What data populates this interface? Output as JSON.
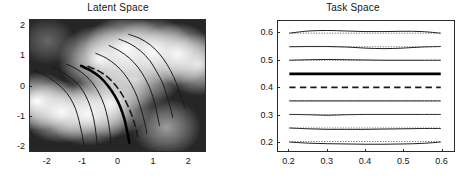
{
  "figure": {
    "background_color": "#ffffff",
    "panel_count": 2
  },
  "panels": [
    {
      "id": "latent",
      "title": "Latent Space"
    },
    {
      "id": "task",
      "title": "Task Space"
    }
  ],
  "chart_data": [
    {
      "type": "line",
      "id": "latent-space",
      "title": "Latent Space",
      "xlabel": "",
      "ylabel": "",
      "xlim": [
        -2.5,
        2.5
      ],
      "ylim": [
        2.2,
        -2.2
      ],
      "y_axis_inverted": true,
      "grid": false,
      "legend": "none",
      "xticks": [
        -2,
        -1,
        0,
        1,
        2
      ],
      "xtick_labels": [
        "-2",
        "-1",
        "0",
        "1",
        "2"
      ],
      "yticks": [
        -2,
        -1,
        0,
        1,
        2
      ],
      "ytick_labels": [
        "-2",
        "-1",
        "0",
        "1",
        "2"
      ],
      "background_image": {
        "type": "grayscale-density",
        "description": "bright diagonal band running lower-left to upper-right, dark corners upper-left and lower-right",
        "dark_color": "#262626",
        "light_color": "#ffffff"
      },
      "series": [
        {
          "name": "trajectory-1",
          "style": "solid",
          "linewidth": 1,
          "color": "#1a1a1a",
          "x": [
            -2.4,
            -2.1,
            -1.8,
            -1.55,
            -1.35,
            -1.2,
            -1.1,
            -1.02,
            -0.96
          ],
          "y": [
            0.52,
            0.36,
            0.14,
            -0.12,
            -0.42,
            -0.78,
            -1.18,
            -1.6,
            -2.0
          ]
        },
        {
          "name": "trajectory-2",
          "style": "solid",
          "linewidth": 1,
          "color": "#1a1a1a",
          "x": [
            -1.9,
            -1.62,
            -1.34,
            -1.1,
            -0.92,
            -0.78,
            -0.68,
            -0.62,
            -0.58
          ],
          "y": [
            0.64,
            0.48,
            0.26,
            0.0,
            -0.32,
            -0.7,
            -1.12,
            -1.56,
            -1.98
          ]
        },
        {
          "name": "trajectory-3",
          "style": "solid",
          "linewidth": 1,
          "color": "#1a1a1a",
          "x": [
            -1.46,
            -1.18,
            -0.92,
            -0.7,
            -0.52,
            -0.38,
            -0.28,
            -0.22,
            -0.18
          ],
          "y": [
            0.72,
            0.56,
            0.34,
            0.06,
            -0.28,
            -0.66,
            -1.1,
            -1.54,
            -1.96
          ]
        },
        {
          "name": "trajectory-4-thick",
          "style": "solid",
          "linewidth": 2.6,
          "color": "#000000",
          "x": [
            -1.04,
            -0.76,
            -0.5,
            -0.28,
            -0.08,
            0.08,
            0.2,
            0.28,
            0.34
          ],
          "y": [
            0.66,
            0.5,
            0.28,
            0.0,
            -0.34,
            -0.72,
            -1.14,
            -1.56,
            -1.92
          ]
        },
        {
          "name": "trajectory-5-dashed",
          "style": "dashed",
          "linewidth": 1.6,
          "color": "#1a1a1a",
          "x": [
            -0.84,
            -0.56,
            -0.3,
            -0.08,
            0.12,
            0.28,
            0.42,
            0.52,
            0.58
          ],
          "y": [
            0.64,
            0.5,
            0.3,
            0.04,
            -0.28,
            -0.64,
            -1.04,
            -1.42,
            -1.74
          ]
        },
        {
          "name": "trajectory-6",
          "style": "solid",
          "linewidth": 1,
          "color": "#1a1a1a",
          "x": [
            -0.24,
            0.06,
            0.34,
            0.58,
            0.78,
            0.94,
            1.06,
            1.14,
            1.2
          ],
          "y": [
            1.34,
            1.16,
            0.92,
            0.62,
            0.26,
            -0.14,
            -0.58,
            -1.0,
            -1.34
          ]
        },
        {
          "name": "trajectory-7",
          "style": "solid",
          "linewidth": 1,
          "color": "#1a1a1a",
          "x": [
            0.04,
            0.36,
            0.66,
            0.92,
            1.12,
            1.3,
            1.42,
            1.52,
            1.58
          ],
          "y": [
            1.56,
            1.4,
            1.16,
            0.84,
            0.46,
            0.06,
            -0.38,
            -0.78,
            -1.08
          ]
        },
        {
          "name": "trajectory-8",
          "style": "solid",
          "linewidth": 1,
          "color": "#1a1a1a",
          "x": [
            0.32,
            0.64,
            0.94,
            1.2,
            1.42,
            1.6,
            1.74,
            1.84,
            1.92
          ],
          "y": [
            1.72,
            1.58,
            1.36,
            1.06,
            0.7,
            0.3,
            -0.1,
            -0.46,
            -0.74
          ]
        },
        {
          "name": "trajectory-9",
          "style": "solid",
          "linewidth": 1,
          "color": "#1a1a1a",
          "x": [
            -0.62,
            -0.32,
            -0.04,
            0.2,
            0.4,
            0.56,
            0.68,
            0.78,
            0.84
          ],
          "y": [
            1.08,
            0.92,
            0.68,
            0.38,
            0.02,
            -0.38,
            -0.82,
            -1.26,
            -1.62
          ]
        }
      ]
    },
    {
      "type": "line",
      "id": "task-space",
      "title": "Task Space",
      "xlabel": "",
      "ylabel": "",
      "xlim": [
        0.17,
        0.635
      ],
      "ylim": [
        0.165,
        0.645
      ],
      "grid": false,
      "legend": "none",
      "xticks": [
        0.2,
        0.3,
        0.4,
        0.5,
        0.6
      ],
      "xtick_labels": [
        "0.2",
        "0.3",
        "0.4",
        "0.5",
        "0.6"
      ],
      "yticks": [
        0.2,
        0.3,
        0.4,
        0.5,
        0.6
      ],
      "ytick_labels": [
        "0.2",
        "0.3",
        "0.4",
        "0.5",
        "0.6"
      ],
      "x_domain": [
        0.2,
        0.6
      ],
      "x_samples": [
        0.2,
        0.25,
        0.3,
        0.35,
        0.4,
        0.45,
        0.5,
        0.55,
        0.6
      ],
      "series": [
        {
          "name": "task-line-0.60",
          "nominal_y": 0.6,
          "style": "solid",
          "linewidth": 1,
          "color": "#1a1a1a",
          "values": [
            0.6,
            0.608,
            0.61,
            0.608,
            0.606,
            0.606,
            0.607,
            0.606,
            0.6
          ]
        },
        {
          "name": "task-line-0.60-dotted",
          "nominal_y": 0.6,
          "style": "dotted",
          "linewidth": 1,
          "color": "#555555",
          "values": [
            0.6,
            0.6,
            0.6,
            0.6,
            0.6,
            0.6,
            0.6,
            0.6,
            0.6
          ]
        },
        {
          "name": "task-line-0.55",
          "nominal_y": 0.55,
          "style": "solid",
          "linewidth": 1,
          "color": "#1a1a1a",
          "values": [
            0.55,
            0.551,
            0.551,
            0.549,
            0.545,
            0.543,
            0.545,
            0.549,
            0.551
          ]
        },
        {
          "name": "task-line-0.55-dotted",
          "nominal_y": 0.55,
          "style": "dotted",
          "linewidth": 1,
          "color": "#555555",
          "values": [
            0.55,
            0.55,
            0.55,
            0.55,
            0.55,
            0.55,
            0.55,
            0.55,
            0.55
          ]
        },
        {
          "name": "task-line-0.50",
          "nominal_y": 0.5,
          "style": "solid",
          "linewidth": 1,
          "color": "#1a1a1a",
          "values": [
            0.5,
            0.502,
            0.503,
            0.502,
            0.501,
            0.5,
            0.5,
            0.5,
            0.5
          ]
        },
        {
          "name": "task-line-0.50-dotted",
          "nominal_y": 0.5,
          "style": "dotted",
          "linewidth": 1,
          "color": "#555555",
          "values": [
            0.5,
            0.5,
            0.5,
            0.5,
            0.5,
            0.5,
            0.5,
            0.5,
            0.5
          ]
        },
        {
          "name": "task-line-0.45-thick",
          "nominal_y": 0.45,
          "style": "solid",
          "linewidth": 2.8,
          "color": "#000000",
          "values": [
            0.45,
            0.45,
            0.45,
            0.45,
            0.45,
            0.45,
            0.45,
            0.45,
            0.45
          ]
        },
        {
          "name": "task-line-0.40-dashed",
          "nominal_y": 0.4,
          "style": "dashed",
          "linewidth": 1.6,
          "color": "#1a1a1a",
          "values": [
            0.4,
            0.4,
            0.4,
            0.4,
            0.4,
            0.4,
            0.4,
            0.4,
            0.4
          ]
        },
        {
          "name": "task-line-0.35",
          "nominal_y": 0.35,
          "style": "solid",
          "linewidth": 1,
          "color": "#1a1a1a",
          "values": [
            0.35,
            0.35,
            0.35,
            0.35,
            0.35,
            0.35,
            0.35,
            0.35,
            0.35
          ]
        },
        {
          "name": "task-line-0.35-dotted",
          "nominal_y": 0.35,
          "style": "dotted",
          "linewidth": 1,
          "color": "#555555",
          "values": [
            0.35,
            0.35,
            0.35,
            0.35,
            0.35,
            0.35,
            0.35,
            0.35,
            0.35
          ]
        },
        {
          "name": "task-line-0.30",
          "nominal_y": 0.3,
          "style": "solid",
          "linewidth": 1,
          "color": "#1a1a1a",
          "values": [
            0.3,
            0.299,
            0.297,
            0.299,
            0.3,
            0.3,
            0.3,
            0.3,
            0.3
          ]
        },
        {
          "name": "task-line-0.30-dotted",
          "nominal_y": 0.3,
          "style": "dotted",
          "linewidth": 1,
          "color": "#555555",
          "values": [
            0.3,
            0.3,
            0.3,
            0.3,
            0.3,
            0.3,
            0.3,
            0.3,
            0.3
          ]
        },
        {
          "name": "task-line-0.25",
          "nominal_y": 0.25,
          "style": "solid",
          "linewidth": 1,
          "color": "#1a1a1a",
          "values": [
            0.25,
            0.247,
            0.245,
            0.245,
            0.245,
            0.246,
            0.247,
            0.248,
            0.248
          ]
        },
        {
          "name": "task-line-0.25-dotted",
          "nominal_y": 0.25,
          "style": "dotted",
          "linewidth": 1,
          "color": "#555555",
          "values": [
            0.25,
            0.25,
            0.25,
            0.25,
            0.25,
            0.25,
            0.25,
            0.25,
            0.25
          ]
        },
        {
          "name": "task-line-0.20",
          "nominal_y": 0.2,
          "style": "solid",
          "linewidth": 1,
          "color": "#1a1a1a",
          "values": [
            0.198,
            0.194,
            0.192,
            0.191,
            0.19,
            0.19,
            0.191,
            0.193,
            0.198
          ]
        },
        {
          "name": "task-line-0.20-dotted",
          "nominal_y": 0.2,
          "style": "dotted",
          "linewidth": 1,
          "color": "#555555",
          "values": [
            0.2,
            0.2,
            0.2,
            0.2,
            0.2,
            0.2,
            0.2,
            0.2,
            0.2
          ]
        }
      ]
    }
  ]
}
